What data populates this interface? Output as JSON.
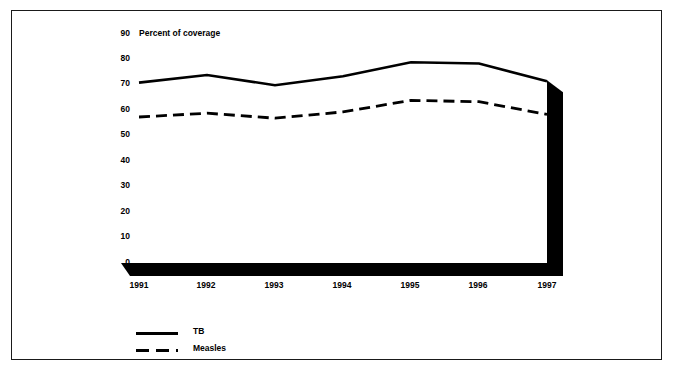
{
  "chart_data": {
    "type": "line",
    "title": "Percent of coverage",
    "xlabel": "",
    "ylabel": "",
    "categories": [
      "1991",
      "1992",
      "1993",
      "1994",
      "1995",
      "1996",
      "1997"
    ],
    "x": [
      1991,
      1992,
      1993,
      1994,
      1995,
      1996,
      1997
    ],
    "series": [
      {
        "name": "TB",
        "style": "solid",
        "color": "#000000",
        "values": [
          70.5,
          73.5,
          69.5,
          73,
          78.5,
          78,
          71
        ]
      },
      {
        "name": "Measles",
        "style": "dashed",
        "color": "#000000",
        "values": [
          57,
          58.5,
          56.5,
          59,
          63.5,
          63,
          58
        ]
      }
    ],
    "ylim": [
      0,
      90
    ],
    "yticks": [
      0,
      10,
      20,
      30,
      40,
      50,
      60,
      70,
      80,
      90
    ],
    "ytick_labels": [
      "0",
      "10",
      "20",
      "30",
      "40",
      "50",
      "60",
      "70",
      "80",
      "90"
    ],
    "xticks": [
      1991,
      1992,
      1993,
      1994,
      1995,
      1996,
      1997
    ],
    "xtick_labels": [
      "1991",
      "1992",
      "1993",
      "1994",
      "1995",
      "1996",
      "1997"
    ],
    "grid": false,
    "legend_position": "bottom-left",
    "legend": [
      "TB",
      "Measles"
    ]
  },
  "axis": {
    "y_ticks": [
      {
        "label": "90",
        "value": 90
      },
      {
        "label": "80",
        "value": 80
      },
      {
        "label": "70",
        "value": 70
      },
      {
        "label": "60",
        "value": 60
      },
      {
        "label": "50",
        "value": 50
      },
      {
        "label": "40",
        "value": 40
      },
      {
        "label": "30",
        "value": 30
      },
      {
        "label": "20",
        "value": 20
      },
      {
        "label": "10",
        "value": 10
      },
      {
        "label": "0",
        "value": 0
      }
    ],
    "x_ticks": [
      {
        "label": "1991"
      },
      {
        "label": "1992"
      },
      {
        "label": "1993"
      },
      {
        "label": "1994"
      },
      {
        "label": "1995"
      },
      {
        "label": "1996"
      },
      {
        "label": "1997"
      }
    ]
  },
  "legend": {
    "items": [
      {
        "label": "TB",
        "style": "solid"
      },
      {
        "label": "Measles",
        "style": "dashed"
      }
    ]
  },
  "colors": {
    "ink": "#000000",
    "frame": "#1a1a1a",
    "background": "#ffffff"
  }
}
